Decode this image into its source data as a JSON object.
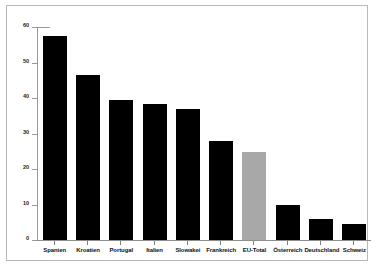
{
  "chart_data": {
    "type": "bar",
    "title": "",
    "subtitle": "",
    "xlabel": "",
    "ylabel": "",
    "ylim": [
      0,
      60
    ],
    "yticks": [
      0,
      10,
      20,
      30,
      40,
      50,
      60
    ],
    "grid": false,
    "legend": "none",
    "categories": [
      "Spanien",
      "Kroatien",
      "Portugal",
      "Italien",
      "Slowakei",
      "Frankreich",
      "EU-Total",
      "Österreich",
      "Deutschland",
      "Schweiz"
    ],
    "values": [
      57.5,
      46.5,
      39.5,
      38.3,
      37.0,
      28.0,
      24.8,
      10.0,
      6.0,
      4.5
    ],
    "bar_colors": [
      "#000000",
      "#000000",
      "#000000",
      "#000000",
      "#000000",
      "#000000",
      "#a8a8a8",
      "#000000",
      "#000000",
      "#000000"
    ],
    "highlight_category": "EU-Total",
    "axis_color": "#9a9a9a",
    "frame_color": "#b9b9b9",
    "background": "#ffffff"
  }
}
